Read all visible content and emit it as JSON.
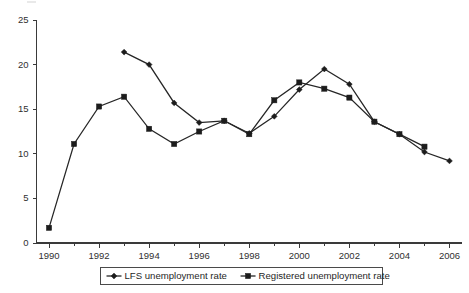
{
  "chart_data": {
    "type": "line",
    "title": "",
    "subtitle": "",
    "xlabel": "",
    "ylabel": "",
    "x": [
      1990,
      1991,
      1992,
      1993,
      1994,
      1995,
      1996,
      1997,
      1998,
      1999,
      2000,
      2001,
      2002,
      2003,
      2004,
      2005,
      2006
    ],
    "xlim": [
      1989.5,
      2006.5
    ],
    "ylim": [
      0,
      25
    ],
    "ytick_labels": [
      "0",
      "5",
      "10",
      "15",
      "20",
      "25"
    ],
    "ytick_values": [
      0,
      5,
      10,
      15,
      20,
      25
    ],
    "xtick_labels": [
      "1990",
      "1992",
      "1994",
      "1996",
      "1998",
      "2000",
      "2002",
      "2004",
      "2006"
    ],
    "xtick_values": [
      1990,
      1992,
      1994,
      1996,
      1998,
      2000,
      2002,
      2004,
      2006
    ],
    "xminor_values": [
      1991,
      1993,
      1995,
      1997,
      1999,
      2001,
      2003,
      2005
    ],
    "grid": false,
    "legend_position": "bottom-center",
    "series": [
      {
        "name": "LFS unemployment rate",
        "marker": "diamond",
        "color": "#1c1c1c",
        "points": [
          {
            "x": 1993,
            "y": 21.4
          },
          {
            "x": 1994,
            "y": 20.0
          },
          {
            "x": 1995,
            "y": 15.7
          },
          {
            "x": 1996,
            "y": 13.5
          },
          {
            "x": 1997,
            "y": 13.7
          },
          {
            "x": 1998,
            "y": 12.3
          },
          {
            "x": 1999,
            "y": 14.2
          },
          {
            "x": 2000,
            "y": 17.2
          },
          {
            "x": 2001,
            "y": 19.5
          },
          {
            "x": 2002,
            "y": 17.8
          },
          {
            "x": 2003,
            "y": 13.6
          },
          {
            "x": 2004,
            "y": 12.2
          },
          {
            "x": 2005,
            "y": 10.2
          },
          {
            "x": 2006,
            "y": 9.2
          }
        ]
      },
      {
        "name": "Registered unemployment rate",
        "marker": "square",
        "color": "#1c1c1c",
        "points": [
          {
            "x": 1990,
            "y": 1.7
          },
          {
            "x": 1991,
            "y": 11.1
          },
          {
            "x": 1992,
            "y": 15.3
          },
          {
            "x": 1993,
            "y": 16.4
          },
          {
            "x": 1994,
            "y": 12.8
          },
          {
            "x": 1995,
            "y": 11.1
          },
          {
            "x": 1996,
            "y": 12.5
          },
          {
            "x": 1997,
            "y": 13.7
          },
          {
            "x": 1998,
            "y": 12.2
          },
          {
            "x": 1999,
            "y": 16.0
          },
          {
            "x": 2000,
            "y": 18.0
          },
          {
            "x": 2001,
            "y": 17.3
          },
          {
            "x": 2002,
            "y": 16.3
          },
          {
            "x": 2003,
            "y": 13.6
          },
          {
            "x": 2004,
            "y": 12.2
          },
          {
            "x": 2005,
            "y": 10.8
          }
        ]
      }
    ],
    "legend": [
      {
        "label": "LFS unemployment rate",
        "marker": "diamond"
      },
      {
        "label": "Registered unemployment rate",
        "marker": "square"
      }
    ]
  },
  "axes": {
    "y_axis_name": "value-axis",
    "x_axis_name": "year-axis"
  }
}
